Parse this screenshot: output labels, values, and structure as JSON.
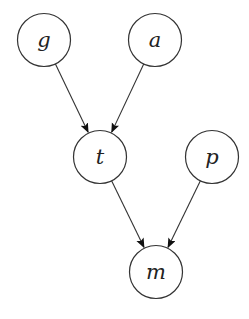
{
  "diagram": {
    "type": "directed-graph",
    "node_radius": 26.5,
    "colors": {
      "background": "#ffffff",
      "stroke": "#333333",
      "label": "#222222"
    },
    "nodes": [
      {
        "id": "g",
        "label": "g",
        "cx": 44,
        "cy": 40
      },
      {
        "id": "a",
        "label": "a",
        "cx": 155,
        "cy": 40
      },
      {
        "id": "t",
        "label": "t",
        "cx": 100,
        "cy": 157
      },
      {
        "id": "p",
        "label": "p",
        "cx": 212,
        "cy": 157
      },
      {
        "id": "m",
        "label": "m",
        "cx": 156,
        "cy": 272
      }
    ],
    "edges": [
      {
        "from": "g",
        "to": "t"
      },
      {
        "from": "a",
        "to": "t"
      },
      {
        "from": "t",
        "to": "m"
      },
      {
        "from": "p",
        "to": "m"
      }
    ]
  }
}
